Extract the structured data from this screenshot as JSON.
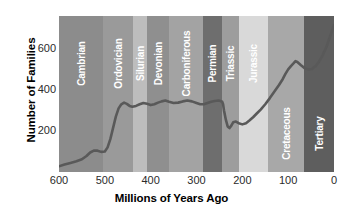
{
  "chart_data": {
    "type": "line",
    "title": "",
    "xlabel": "Millions of Years Ago",
    "ylabel": "Number of Families",
    "xlim": [
      600,
      0
    ],
    "ylim": [
      0,
      760
    ],
    "x_ticks": [
      600,
      500,
      400,
      300,
      200,
      100,
      0
    ],
    "y_ticks": [
      200,
      400,
      600
    ],
    "grid": false,
    "legend": "none",
    "axis_direction": "x reversed (600 Mya on left, 0 Mya on right)",
    "line_color": "#595959",
    "series": [
      {
        "name": "Number of Families",
        "x": [
          600,
          588,
          575,
          562,
          550,
          540,
          532,
          524,
          516,
          508,
          500,
          494,
          488,
          482,
          476,
          470,
          464,
          458,
          452,
          446,
          440,
          432,
          424,
          416,
          408,
          400,
          392,
          384,
          376,
          368,
          360,
          350,
          340,
          330,
          320,
          310,
          300,
          292,
          284,
          276,
          268,
          260,
          252,
          248,
          244,
          242,
          240,
          236,
          232,
          228,
          224,
          220,
          214,
          208,
          200,
          192,
          184,
          176,
          168,
          160,
          150,
          140,
          130,
          120,
          112,
          106,
          100,
          94,
          88,
          84,
          80,
          72,
          64,
          56,
          48,
          40,
          32,
          24,
          16,
          8,
          0
        ],
        "y": [
          28,
          36,
          44,
          52,
          62,
          78,
          95,
          104,
          104,
          98,
          100,
          120,
          160,
          215,
          270,
          310,
          330,
          338,
          332,
          322,
          318,
          322,
          330,
          336,
          332,
          326,
          330,
          338,
          344,
          348,
          342,
          336,
          338,
          344,
          348,
          344,
          336,
          330,
          330,
          336,
          342,
          346,
          348,
          346,
          342,
          330,
          300,
          255,
          222,
          214,
          226,
          242,
          246,
          238,
          232,
          238,
          252,
          268,
          286,
          304,
          330,
          360,
          392,
          424,
          452,
          478,
          500,
          516,
          530,
          540,
          536,
          520,
          506,
          500,
          502,
          516,
          540,
          572,
          612,
          664,
          716
        ]
      }
    ],
    "annotation": "Curve shows a slow Precambrian/early Cambrian rise, the Ordovician radiation to ~340 families, a long Paleozoic plateau near 330-350, a sharp end-Permian drop to ~215, recovery through the Mesozoic, an end-Cretaceous dip near 500, and a steep Cenozoic rise to ~720 families at present."
  },
  "bands": [
    {
      "name": "Cambrian",
      "start": 600,
      "end": 505,
      "color": "#8c8c8c",
      "label": "Cambrian",
      "label_pos": "top"
    },
    {
      "name": "Ordovician",
      "start": 505,
      "end": 438,
      "color": "#9a9a9a",
      "label": "Ordovician",
      "label_pos": "top"
    },
    {
      "name": "Silurian",
      "start": 438,
      "end": 408,
      "color": "#bdbdbd",
      "label": "Silurian",
      "label_pos": "top"
    },
    {
      "name": "Devonian",
      "start": 408,
      "end": 360,
      "color": "#8f8f8f",
      "label": "Devonian",
      "label_pos": "top"
    },
    {
      "name": "Carboniferous",
      "start": 360,
      "end": 286,
      "color": "#a3a3a3",
      "label": "Carboniferous",
      "label_pos": "top"
    },
    {
      "name": "Permian",
      "start": 286,
      "end": 245,
      "color": "#6e6e6e",
      "label": "Permian",
      "label_pos": "top"
    },
    {
      "name": "Triassic",
      "start": 245,
      "end": 208,
      "color": "#9d9d9d",
      "label": "Triassic",
      "label_pos": "top"
    },
    {
      "name": "Jurassic",
      "start": 208,
      "end": 145,
      "color": "#d9d9d9",
      "label": "Jurassic",
      "label_pos": "top"
    },
    {
      "name": "Cretaceous",
      "start": 145,
      "end": 65,
      "color": "#a8a8a8",
      "label": "Cretaceous",
      "label_pos": "bottom"
    },
    {
      "name": "Tertiary",
      "start": 65,
      "end": 0,
      "color": "#5e5e5e",
      "label": "Tertiary",
      "label_pos": "bottom"
    }
  ],
  "axes": {
    "y_title": "Number of Families",
    "x_title": "Millions of Years Ago",
    "y_tick_labels": [
      "600",
      "400",
      "200"
    ],
    "x_tick_labels": [
      "600",
      "500",
      "400",
      "300",
      "200",
      "100",
      "0"
    ]
  }
}
